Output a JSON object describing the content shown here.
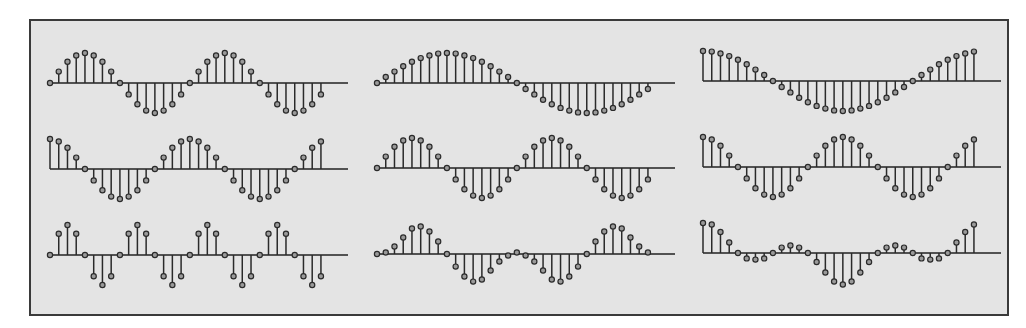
{
  "figure": {
    "frame_background": "#e4e4e4",
    "frame_border": "#3a3a3a",
    "stem_color": "#2a2a2a",
    "marker_fill": "#9a9a9a"
  },
  "chart_data": [
    {
      "type": "stem",
      "title": "",
      "position": "row1-col1",
      "description": "sin, 2 periods over 32 samples",
      "x_start": 50,
      "dx": 8.74,
      "axis_y": 83,
      "axis_x_end": 348,
      "scale": 30,
      "values": [
        0,
        0.38,
        0.71,
        0.92,
        1,
        0.92,
        0.71,
        0.38,
        0,
        -0.38,
        -0.71,
        -0.92,
        -1,
        -0.92,
        -0.71,
        -0.38,
        0,
        0.38,
        0.71,
        0.92,
        1,
        0.92,
        0.71,
        0.38,
        0,
        -0.38,
        -0.71,
        -0.92,
        -1,
        -0.92,
        -0.71,
        -0.38
      ]
    },
    {
      "type": "stem",
      "title": "",
      "position": "row1-col2",
      "description": "sin, 1 period over 32 samples",
      "x_start": 377,
      "dx": 8.74,
      "axis_y": 83,
      "axis_x_end": 675,
      "scale": 30,
      "values": [
        0,
        0.2,
        0.38,
        0.56,
        0.71,
        0.83,
        0.92,
        0.98,
        1,
        0.98,
        0.92,
        0.83,
        0.71,
        0.56,
        0.38,
        0.2,
        0,
        -0.2,
        -0.38,
        -0.56,
        -0.71,
        -0.83,
        -0.92,
        -0.98,
        -1,
        -0.98,
        -0.92,
        -0.83,
        -0.71,
        -0.56,
        -0.38,
        -0.2
      ]
    },
    {
      "type": "stem",
      "title": "",
      "position": "row1-col3",
      "description": "cos, 1 period over 32 samples",
      "x_start": 703,
      "dx": 8.74,
      "axis_y": 81,
      "axis_x_end": 1001,
      "scale": 30,
      "values": [
        1,
        0.98,
        0.92,
        0.83,
        0.71,
        0.56,
        0.38,
        0.2,
        0,
        -0.2,
        -0.38,
        -0.56,
        -0.71,
        -0.83,
        -0.92,
        -0.98,
        -1,
        -0.98,
        -0.92,
        -0.83,
        -0.71,
        -0.56,
        -0.38,
        -0.2,
        0,
        0.2,
        0.38,
        0.56,
        0.71,
        0.83,
        0.92,
        0.98
      ]
    },
    {
      "type": "stem",
      "title": "",
      "position": "row2-col1",
      "description": "cos, 2 periods over 32 samples",
      "x_start": 50,
      "dx": 8.74,
      "axis_y": 169,
      "axis_x_end": 348,
      "scale": 30,
      "values": [
        1,
        0.92,
        0.71,
        0.38,
        0,
        -0.38,
        -0.71,
        -0.92,
        -1,
        -0.92,
        -0.71,
        -0.38,
        0,
        0.38,
        0.71,
        0.92,
        1,
        0.92,
        0.71,
        0.38,
        0,
        -0.38,
        -0.71,
        -0.92,
        -1,
        -0.92,
        -0.71,
        -0.38,
        0,
        0.38,
        0.71,
        0.92
      ]
    },
    {
      "type": "stem",
      "title": "",
      "position": "row2-col2",
      "description": "sin, 2 periods over 32 samples",
      "x_start": 377,
      "dx": 8.74,
      "axis_y": 168,
      "axis_x_end": 675,
      "scale": 30,
      "values": [
        0,
        0.38,
        0.71,
        0.92,
        1,
        0.92,
        0.71,
        0.38,
        0,
        -0.38,
        -0.71,
        -0.92,
        -1,
        -0.92,
        -0.71,
        -0.38,
        0,
        0.38,
        0.71,
        0.92,
        1,
        0.92,
        0.71,
        0.38,
        0,
        -0.38,
        -0.71,
        -0.92,
        -1,
        -0.92,
        -0.71,
        -0.38
      ]
    },
    {
      "type": "stem",
      "title": "",
      "position": "row2-col3",
      "description": "cos, 2 periods over 32 samples",
      "x_start": 703,
      "dx": 8.74,
      "axis_y": 167,
      "axis_x_end": 1001,
      "scale": 30,
      "values": [
        1,
        0.92,
        0.71,
        0.38,
        0,
        -0.38,
        -0.71,
        -0.92,
        -1,
        -0.92,
        -0.71,
        -0.38,
        0,
        0.38,
        0.71,
        0.92,
        1,
        0.92,
        0.71,
        0.38,
        0,
        -0.38,
        -0.71,
        -0.92,
        -1,
        -0.92,
        -0.71,
        -0.38,
        0,
        0.38,
        0.71,
        0.92
      ]
    },
    {
      "type": "stem",
      "title": "",
      "position": "row3-col1",
      "description": "sin, 4 periods over 32 samples",
      "x_start": 50,
      "dx": 8.74,
      "axis_y": 255,
      "axis_x_end": 348,
      "scale": 30,
      "values": [
        0,
        0.71,
        1,
        0.71,
        0,
        -0.71,
        -1,
        -0.71,
        0,
        0.71,
        1,
        0.71,
        0,
        -0.71,
        -1,
        -0.71,
        0,
        0.71,
        1,
        0.71,
        0,
        -0.71,
        -1,
        -0.71,
        0,
        0.71,
        1,
        0.71,
        0,
        -0.71,
        -1,
        -0.71
      ]
    },
    {
      "type": "stem",
      "title": "",
      "position": "row3-col2",
      "description": "beat / modulated sine over 32 samples",
      "x_start": 377,
      "dx": 8.74,
      "axis_y": 254,
      "axis_x_end": 675,
      "scale": 30,
      "values": [
        0,
        0.05,
        0.25,
        0.55,
        0.85,
        0.92,
        0.75,
        0.42,
        0,
        -0.42,
        -0.75,
        -0.92,
        -0.85,
        -0.55,
        -0.25,
        -0.05,
        0.05,
        -0.05,
        -0.25,
        -0.55,
        -0.85,
        -0.92,
        -0.75,
        -0.42,
        0,
        0.42,
        0.75,
        0.92,
        0.85,
        0.55,
        0.25,
        0.05
      ]
    },
    {
      "type": "stem",
      "title": "",
      "position": "row3-col3",
      "description": "sum of cosines over 32 samples",
      "x_start": 703,
      "dx": 8.74,
      "axis_y": 253,
      "axis_x_end": 1001,
      "scale": 30,
      "values": [
        1,
        0.95,
        0.7,
        0.35,
        0,
        -0.18,
        -0.22,
        -0.18,
        0,
        0.18,
        0.25,
        0.18,
        0,
        -0.3,
        -0.65,
        -0.95,
        -1.05,
        -0.95,
        -0.65,
        -0.3,
        0,
        0.18,
        0.25,
        0.18,
        0,
        -0.18,
        -0.22,
        -0.18,
        0,
        0.35,
        0.7,
        0.95
      ]
    }
  ]
}
